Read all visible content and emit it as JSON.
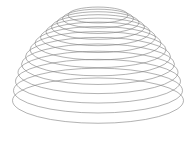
{
  "figure": {
    "name": "wireframe-dome",
    "title": "Wireframe dome surface of revolution",
    "render_style": "line-wireframe",
    "background_color": "#ffffff",
    "line_color": "#7d7d7d",
    "line_width_px": 0.6,
    "canvas": {
      "width": 196,
      "height": 144
    }
  },
  "chart_data": {
    "type": "line",
    "title": "Wireframe dome surface of revolution",
    "subtitle": "",
    "xlabel": "",
    "ylabel": "",
    "xlim": [
      0,
      196
    ],
    "ylim": [
      0,
      144
    ],
    "grid": false,
    "legend_position": "none",
    "axes_visible": false,
    "tick_labels": [],
    "annotations": [],
    "projection": {
      "type": "oblique-elliptical",
      "center_x": 98,
      "ellipse_flatten_ratio": 0.265,
      "note": "Each circular cross-section of radius r is drawn as an ellipse with horizontal semi-axis r and vertical semi-axis r * flatten_ratio, centered on the axis of revolution at the ring's projected height."
    },
    "series": [
      {
        "name": "cross-section-rings",
        "element": "ellipse",
        "count": 14,
        "values": [
          {
            "index": 0,
            "cx": 98,
            "cy": 15.0,
            "rx": 30.0,
            "ry": 7.95
          },
          {
            "index": 1,
            "cx": 98,
            "cy": 18.6,
            "rx": 35.5,
            "ry": 9.41
          },
          {
            "index": 2,
            "cx": 98,
            "cy": 22.6,
            "rx": 41.0,
            "ry": 10.87
          },
          {
            "index": 3,
            "cx": 98,
            "cy": 27.0,
            "rx": 46.5,
            "ry": 12.32
          },
          {
            "index": 4,
            "cx": 98,
            "cy": 31.9,
            "rx": 52.0,
            "ry": 13.78
          },
          {
            "index": 5,
            "cx": 98,
            "cy": 37.3,
            "rx": 57.5,
            "ry": 15.24
          },
          {
            "index": 6,
            "cx": 98,
            "cy": 43.2,
            "rx": 63.0,
            "ry": 16.7
          },
          {
            "index": 7,
            "cx": 98,
            "cy": 49.6,
            "rx": 68.0,
            "ry": 18.02
          },
          {
            "index": 8,
            "cx": 98,
            "cy": 56.6,
            "rx": 72.5,
            "ry": 19.21
          },
          {
            "index": 9,
            "cx": 98,
            "cy": 64.2,
            "rx": 76.5,
            "ry": 20.27
          },
          {
            "index": 10,
            "cx": 98,
            "cy": 72.4,
            "rx": 80.0,
            "ry": 21.2
          },
          {
            "index": 11,
            "cx": 98,
            "cy": 81.2,
            "rx": 82.5,
            "ry": 21.86
          },
          {
            "index": 12,
            "cx": 98,
            "cy": 90.6,
            "rx": 84.5,
            "ry": 22.39
          },
          {
            "index": 13,
            "cx": 98,
            "cy": 100.6,
            "rx": 85.5,
            "ry": 22.66
          }
        ]
      }
    ]
  }
}
